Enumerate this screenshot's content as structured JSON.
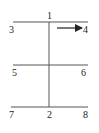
{
  "diagram": {
    "labels": {
      "top": "1",
      "bottom": "2",
      "top_left": "3",
      "top_right": "4",
      "mid_left": "5",
      "mid_right": "6",
      "bottom_left": "7",
      "bottom_right": "8"
    },
    "arrow": {
      "direction": "right",
      "target": "4"
    },
    "colors": {
      "line": "#555555",
      "text": "#222222",
      "background": "#ffffff"
    }
  }
}
